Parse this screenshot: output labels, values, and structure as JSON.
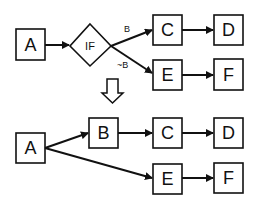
{
  "diagram": {
    "top": {
      "nodes": {
        "a": "A",
        "if": "IF",
        "c": "C",
        "d": "D",
        "e": "E",
        "f": "F"
      },
      "edge_labels": {
        "true_branch": "B",
        "false_branch": "~B"
      }
    },
    "transform_arrow": "down-arrow",
    "bottom": {
      "nodes": {
        "a": "A",
        "b": "B",
        "c": "C",
        "d": "D",
        "e": "E",
        "f": "F"
      }
    },
    "colors": {
      "stroke": "#111111",
      "background": "#ffffff"
    }
  }
}
